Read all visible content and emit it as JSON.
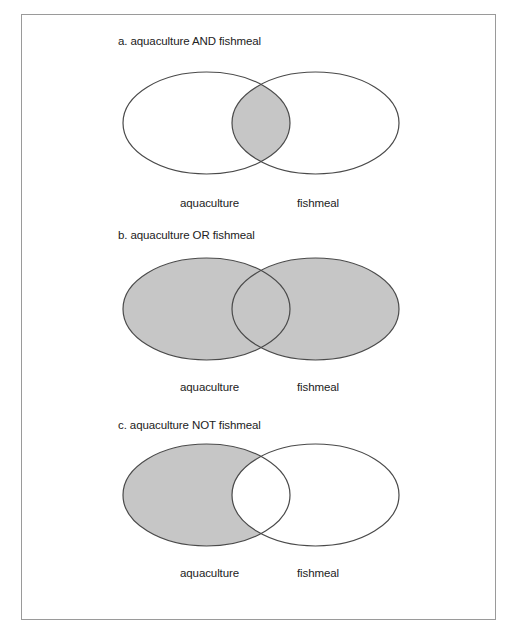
{
  "colors": {
    "fill": "#c6c6c6",
    "stroke": "#4a4a4a",
    "border": "#9a9a9a"
  },
  "diagrams": [
    {
      "id": "a",
      "title": "a. aquaculture AND fishmeal",
      "operator": "AND",
      "shaded": "intersection",
      "left_label": "aquaculture",
      "right_label": "fishmeal"
    },
    {
      "id": "b",
      "title": "b. aquaculture OR fishmeal",
      "operator": "OR",
      "shaded": "union",
      "left_label": "aquaculture",
      "right_label": "fishmeal"
    },
    {
      "id": "c",
      "title": "c. aquaculture NOT fishmeal",
      "operator": "NOT",
      "shaded": "left-minus-right",
      "left_label": "aquaculture",
      "right_label": "fishmeal"
    }
  ]
}
